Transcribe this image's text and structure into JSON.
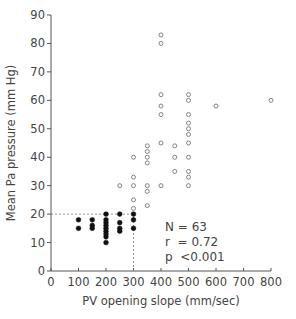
{
  "chart_data": {
    "type": "scatter",
    "title": "",
    "xlabel": "PV opening slope (mm/sec)",
    "ylabel": "Mean Pa pressure (mm Hg)",
    "xlim": [
      0,
      800
    ],
    "ylim": [
      0,
      90
    ],
    "xticks": [
      0,
      100,
      200,
      300,
      400,
      500,
      600,
      700,
      800
    ],
    "yticks": [
      0,
      10,
      20,
      30,
      40,
      50,
      60,
      70,
      80,
      90
    ],
    "grid": false,
    "legend": null,
    "reference_lines": [
      {
        "type": "horizontal",
        "y": 20,
        "x_from": 0,
        "x_to": 300,
        "style": "dashed"
      },
      {
        "type": "vertical",
        "x": 300,
        "y_from": 0,
        "y_to": 20,
        "style": "dashed"
      }
    ],
    "series": [
      {
        "name": "PV slope <= 300, Pa <= 20",
        "marker": "filled-circle",
        "points": [
          [
            100,
            18
          ],
          [
            100,
            15
          ],
          [
            150,
            18
          ],
          [
            150,
            16
          ],
          [
            150,
            15
          ],
          [
            200,
            20
          ],
          [
            200,
            18
          ],
          [
            200,
            17
          ],
          [
            200,
            15
          ],
          [
            200,
            14
          ],
          [
            200,
            13
          ],
          [
            200,
            12
          ],
          [
            200,
            10
          ],
          [
            200,
            16
          ],
          [
            250,
            20
          ],
          [
            250,
            17
          ],
          [
            250,
            15
          ],
          [
            250,
            14
          ],
          [
            300,
            20
          ],
          [
            300,
            18
          ],
          [
            300,
            15
          ]
        ]
      },
      {
        "name": "PV slope >= 250, Pa > 20",
        "marker": "open-circle",
        "points": [
          [
            250,
            30
          ],
          [
            300,
            40
          ],
          [
            300,
            33
          ],
          [
            300,
            30
          ],
          [
            300,
            25
          ],
          [
            300,
            22
          ],
          [
            350,
            44
          ],
          [
            350,
            42
          ],
          [
            350,
            40
          ],
          [
            350,
            38
          ],
          [
            350,
            30
          ],
          [
            350,
            28
          ],
          [
            350,
            23
          ],
          [
            400,
            83
          ],
          [
            400,
            80
          ],
          [
            400,
            62
          ],
          [
            400,
            58
          ],
          [
            400,
            55
          ],
          [
            400,
            45
          ],
          [
            400,
            30
          ],
          [
            450,
            44
          ],
          [
            450,
            40
          ],
          [
            450,
            35
          ],
          [
            500,
            62
          ],
          [
            500,
            60
          ],
          [
            500,
            55
          ],
          [
            500,
            52
          ],
          [
            500,
            50
          ],
          [
            500,
            48
          ],
          [
            500,
            45
          ],
          [
            500,
            40
          ],
          [
            500,
            35
          ],
          [
            500,
            33
          ],
          [
            500,
            30
          ],
          [
            600,
            58
          ],
          [
            800,
            60
          ]
        ]
      }
    ],
    "annotations": [
      {
        "text": "N = 63"
      },
      {
        "text": "r  = 0.72"
      },
      {
        "text": "p  <0.001"
      }
    ]
  },
  "stats": {
    "n": "N = 63",
    "r": "r  = 0.72",
    "p": "p  <0.001"
  },
  "labels": {
    "xlabel": "PV opening slope (mm/sec)",
    "ylabel": "Mean Pa pressure (mm Hg)"
  }
}
